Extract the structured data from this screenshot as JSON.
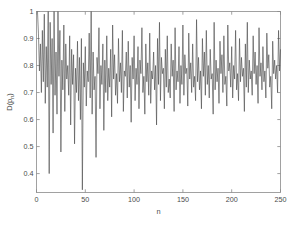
{
  "chart_data": {
    "type": "line",
    "title": "",
    "subtitle": "",
    "xlabel": "n",
    "ylabel": "D(p_n)",
    "ylabel_base": "D(p",
    "ylabel_sub": "n",
    "ylabel_close": ")",
    "grid": false,
    "legend": null,
    "line_color": "#4d4d4d",
    "axis_color": "#8a8a8a",
    "background": "#ffffff",
    "xlim": [
      0,
      250
    ],
    "ylim": [
      0.33,
      1.0
    ],
    "xticks": [
      0,
      50,
      100,
      150,
      200,
      250
    ],
    "xticklabels": [
      "0",
      "50",
      "100",
      "150",
      "200",
      "250"
    ],
    "yticks": [
      0.4,
      0.5,
      0.6,
      0.7,
      0.8,
      0.9,
      1.0
    ],
    "yticklabels": [
      "0.4",
      "0.5",
      "0.6",
      "0.7",
      "0.8",
      "0.9",
      "1"
    ],
    "series": [
      {
        "name": "D(p_n)",
        "x_start": 1,
        "x_step": 1,
        "values": [
          1.0,
          0.92,
          0.78,
          0.88,
          0.7,
          0.93,
          0.74,
          0.99,
          0.66,
          0.87,
          0.72,
          1.0,
          0.4,
          0.96,
          0.73,
          0.9,
          0.55,
          1.0,
          0.69,
          0.85,
          0.62,
          1.0,
          0.76,
          0.93,
          0.48,
          0.82,
          0.71,
          0.95,
          0.63,
          0.88,
          0.75,
          0.8,
          0.69,
          0.91,
          0.58,
          0.86,
          0.73,
          0.84,
          0.51,
          0.79,
          0.7,
          0.89,
          0.67,
          0.83,
          0.6,
          0.9,
          0.34,
          0.81,
          0.72,
          0.87,
          0.65,
          0.78,
          0.74,
          0.92,
          0.68,
          1.0,
          0.62,
          0.85,
          0.71,
          0.76,
          0.46,
          0.83,
          0.77,
          0.94,
          0.64,
          0.8,
          0.73,
          0.88,
          0.56,
          0.82,
          0.7,
          0.91,
          0.67,
          0.79,
          0.72,
          0.86,
          0.61,
          0.95,
          0.75,
          0.84,
          0.69,
          0.77,
          0.66,
          0.9,
          0.74,
          0.81,
          0.7,
          0.93,
          0.63,
          0.78,
          0.76,
          0.85,
          0.68,
          0.89,
          0.72,
          0.8,
          0.59,
          0.83,
          0.75,
          0.91,
          0.67,
          0.79,
          0.73,
          0.87,
          0.64,
          0.82,
          0.77,
          0.94,
          0.7,
          0.76,
          0.62,
          0.88,
          0.74,
          0.81,
          0.69,
          0.92,
          0.66,
          0.78,
          0.75,
          0.85,
          0.71,
          0.8,
          0.58,
          0.9,
          0.73,
          0.96,
          0.67,
          0.83,
          0.77,
          0.79,
          0.64,
          0.86,
          0.72,
          0.91,
          0.7,
          0.75,
          0.68,
          0.88,
          0.76,
          0.82,
          0.63,
          0.94,
          0.71,
          0.78,
          0.74,
          0.87,
          0.66,
          0.8,
          0.73,
          0.95,
          0.69,
          0.84,
          0.77,
          0.79,
          0.65,
          0.92,
          0.75,
          0.81,
          0.7,
          0.88,
          0.72,
          0.76,
          0.67,
          0.97,
          0.74,
          0.83,
          0.71,
          0.78,
          0.64,
          0.9,
          0.76,
          0.85,
          0.69,
          0.93,
          0.73,
          0.8,
          0.68,
          0.86,
          0.75,
          0.77,
          0.62,
          0.96,
          0.71,
          0.82,
          0.74,
          0.79,
          0.66,
          0.89,
          0.77,
          0.84,
          0.7,
          0.91,
          0.73,
          0.76,
          0.65,
          0.95,
          0.78,
          0.81,
          0.72,
          0.87,
          0.68,
          0.8,
          0.75,
          0.93,
          0.71,
          0.77,
          0.67,
          0.9,
          0.74,
          0.83,
          0.76,
          0.79,
          0.63,
          0.88,
          0.72,
          0.96,
          0.7,
          0.82,
          0.75,
          0.78,
          0.69,
          0.91,
          0.77,
          0.85,
          0.73,
          0.8,
          0.66,
          0.94,
          0.76,
          0.81,
          0.71,
          0.87,
          0.74,
          0.78,
          0.68,
          0.92,
          0.79,
          0.84,
          0.72,
          0.76,
          0.64,
          0.89,
          0.77,
          0.82,
          0.75,
          0.8,
          0.7,
          0.93,
          0.78,
          0.86
        ]
      }
    ]
  }
}
